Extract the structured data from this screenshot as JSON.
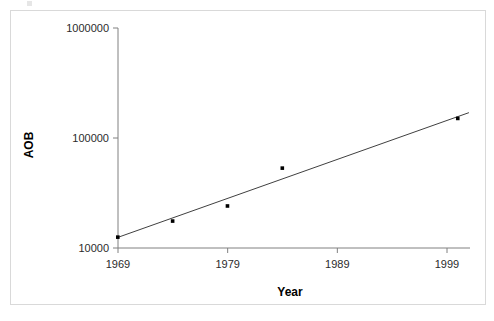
{
  "figure": {
    "background_color": "#ffffff",
    "frame_border_color": "#d9d9d9"
  },
  "chart_data": {
    "type": "scatter",
    "title": "",
    "subtitle": "",
    "xlabel": "Year",
    "ylabel": "AOB",
    "xlim": [
      1969,
      2003
    ],
    "ylim": [
      10000,
      1000000
    ],
    "yscale": "log",
    "xticks": [
      1969,
      1979,
      1989,
      1999
    ],
    "xtick_labels": [
      "1969",
      "1979",
      "1989",
      "1999"
    ],
    "yticks": [
      10000,
      100000,
      1000000
    ],
    "ytick_labels": [
      "10000",
      "100000",
      "1000000"
    ],
    "grid": false,
    "legend": false,
    "legend_position": "none",
    "marker_color": "#000000",
    "line_color": "#404040",
    "axis_color": "#808080",
    "series": [
      {
        "name": "AOB observations",
        "type": "scatter",
        "x": [
          1969,
          1974,
          1979,
          1984,
          2000
        ],
        "y": [
          12500,
          17500,
          24000,
          53000,
          150000
        ]
      },
      {
        "name": "trend line",
        "type": "line",
        "x": [
          1969,
          2001
        ],
        "y": [
          12500,
          170000
        ]
      }
    ],
    "annotations": []
  }
}
